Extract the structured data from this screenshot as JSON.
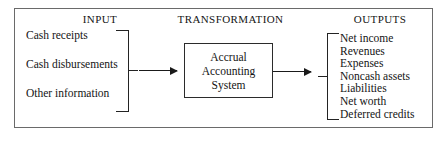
{
  "diagram": {
    "columns": {
      "input_heading": "INPUT",
      "transformation_heading": "TRANSFORMATION",
      "outputs_heading": "OUTPUTS"
    },
    "inputs": [
      {
        "label": "Cash receipts"
      },
      {
        "label": "Cash disbursements"
      },
      {
        "label": "Other information"
      }
    ],
    "system_box": {
      "line1": "Accrual",
      "line2": "Accounting",
      "line3": "System"
    },
    "outputs": [
      {
        "label": "Net income"
      },
      {
        "label": "Revenues"
      },
      {
        "label": "Expenses"
      },
      {
        "label": "Noncash assets"
      },
      {
        "label": "Liabilities"
      },
      {
        "label": "Net worth"
      },
      {
        "label": "Deferred credits"
      }
    ],
    "connectors": {
      "input_arrow": "arrow-right",
      "output_arrow": "arrow-right",
      "input_bracket": "right-brace",
      "output_bracket": "left-brace"
    },
    "colors": {
      "frame_border": "#6a6a6a",
      "box_border": "#2b2b2b",
      "text": "#141414",
      "arrow": "#1a1a1a",
      "background": "#ffffff"
    }
  }
}
